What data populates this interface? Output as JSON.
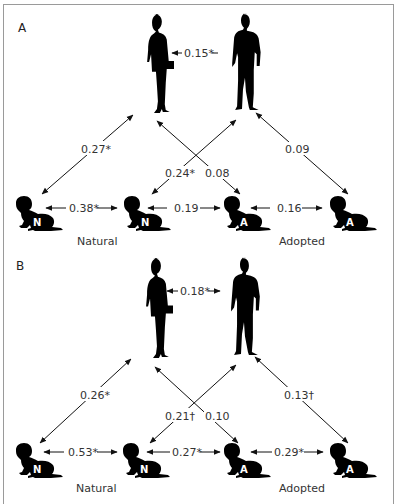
{
  "figure": {
    "panels": [
      {
        "label": "A",
        "parent_correlation": "0.15*",
        "diagonals": {
          "mother_natural": "0.27*",
          "father_natural": "0.24*",
          "mother_adopted": "0.08",
          "father_adopted": "0.09"
        },
        "sibling_links": [
          "0.38*",
          "0.19",
          "0.16"
        ],
        "children": [
          "N",
          "N",
          "A",
          "A"
        ],
        "group_labels": {
          "natural": "Natural",
          "adopted": "Adopted"
        }
      },
      {
        "label": "B",
        "parent_correlation": "0.18*",
        "diagonals": {
          "mother_natural": "0.26*",
          "father_natural": "0.21†",
          "mother_adopted": "0.10",
          "father_adopted": "0.13†"
        },
        "sibling_links": [
          "0.53*",
          "0.27*",
          "0.29*"
        ],
        "children": [
          "N",
          "N",
          "A",
          "A"
        ],
        "group_labels": {
          "natural": "Natural",
          "adopted": "Adopted"
        }
      }
    ],
    "colors": {
      "ink": "#000000",
      "text": "#333333",
      "border": "#9a9a9a",
      "background": "#ffffff"
    }
  }
}
